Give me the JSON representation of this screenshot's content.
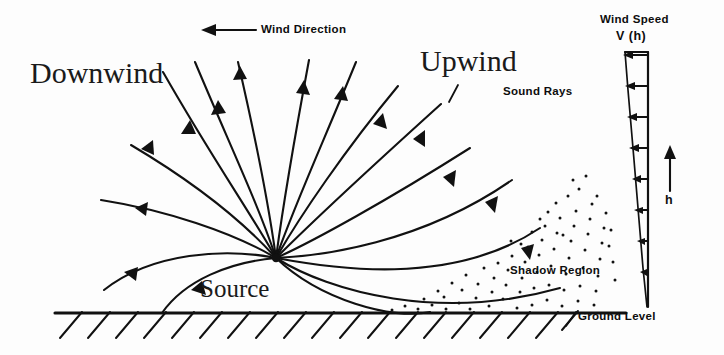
{
  "figure": {
    "kind": "acoustic-ray-refraction-diagram",
    "background_color": "#fdfdfd",
    "ink_color": "#111111"
  },
  "labels": {
    "downwind": "Downwind",
    "upwind": "Upwind",
    "source": "Source",
    "wind_direction": "Wind Direction",
    "sound_rays": "Sound Rays",
    "shadow_region": "Shadow Region",
    "ground_level": "Ground Level",
    "wind_speed": "Wind Speed",
    "wind_speed_function": "V (h)",
    "height_axis": "h"
  },
  "diagram_data": {
    "type": "schematic",
    "source_point": {
      "x": 276,
      "y": 258
    },
    "ground_line": {
      "x1": 55,
      "x2": 626,
      "y": 313
    },
    "wind_direction_arrow": {
      "x_from": 256,
      "x_to": 203,
      "y": 30,
      "points": "left"
    },
    "height_arrow": {
      "x": 670,
      "y_from": 191,
      "y_to": 147,
      "points": "up"
    },
    "wind_profile_wedge": {
      "top_y": 52,
      "tip_y": 307,
      "right_edge_x": 648,
      "top_left_x": 625,
      "arrow_rows_y": [
        56,
        88,
        118,
        149,
        180,
        211,
        242,
        273
      ],
      "arrow_direction": "left",
      "description": "wind speed increases with height; arrow lengths shrink toward ground"
    },
    "downwind_rays": {
      "count": 7,
      "description": "rays launched to the left arc over and refract back down toward the ground"
    },
    "upwind_rays": {
      "count": 8,
      "description": "rays launched to the right refract upward away from the ground, forming a shadow region"
    },
    "shadow_region": {
      "description": "dotted triangular area bounded above by the lowest upwind ray and below by the ground",
      "dot_count": 78
    }
  }
}
